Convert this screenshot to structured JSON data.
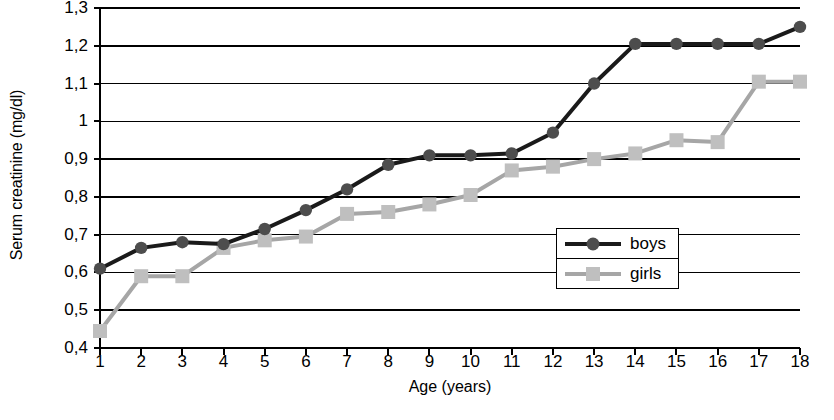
{
  "chart_data": {
    "type": "line",
    "title": "",
    "xlabel": "Age (years)",
    "ylabel": "Serum creatinine (mg/dl)",
    "x": [
      1,
      2,
      3,
      4,
      5,
      6,
      7,
      8,
      9,
      10,
      11,
      12,
      13,
      14,
      15,
      16,
      17,
      18
    ],
    "xtick_labels": [
      "1",
      "2",
      "3",
      "4",
      "5",
      "6",
      "7",
      "8",
      "9",
      "10",
      "11",
      "12",
      "13",
      "14",
      "15",
      "16",
      "17",
      "18"
    ],
    "xlim": [
      1,
      18
    ],
    "ylim": [
      0.4,
      1.3
    ],
    "ytick_values": [
      0.4,
      0.5,
      0.6,
      0.7,
      0.8,
      0.9,
      1.0,
      1.1,
      1.2,
      1.3
    ],
    "ytick_labels": [
      "0,4",
      "0,5",
      "0,6",
      "0,7",
      "0,8",
      "0,9",
      "1",
      "1,1",
      "1,2",
      "1,3"
    ],
    "grid": "horizontal",
    "legend_position": "inside-lower-right",
    "series": [
      {
        "name": "boys",
        "color": "#1a1a1a",
        "marker": "circle",
        "marker_color": "#4d4d4d",
        "values": [
          0.61,
          0.665,
          0.68,
          0.675,
          0.715,
          0.765,
          0.82,
          0.885,
          0.91,
          0.91,
          0.915,
          0.97,
          1.1,
          1.205,
          1.205,
          1.205,
          1.205,
          1.25
        ]
      },
      {
        "name": "girls",
        "color": "#a6a6a6",
        "marker": "square",
        "marker_color": "#bfbfbf",
        "values": [
          0.445,
          0.59,
          0.59,
          0.665,
          0.685,
          0.695,
          0.755,
          0.76,
          0.78,
          0.805,
          0.87,
          0.88,
          0.9,
          0.915,
          0.95,
          0.945,
          1.105,
          1.105
        ]
      }
    ]
  },
  "legend": {
    "entries": [
      {
        "label": "boys"
      },
      {
        "label": "girls"
      }
    ]
  },
  "axis_colors": {
    "axis_line": "#000000",
    "gridline": "#000000",
    "boys_line": "#1a1a1a",
    "boys_marker": "#4d4d4d",
    "girls_line": "#a6a6a6",
    "girls_marker": "#bfbfbf"
  }
}
